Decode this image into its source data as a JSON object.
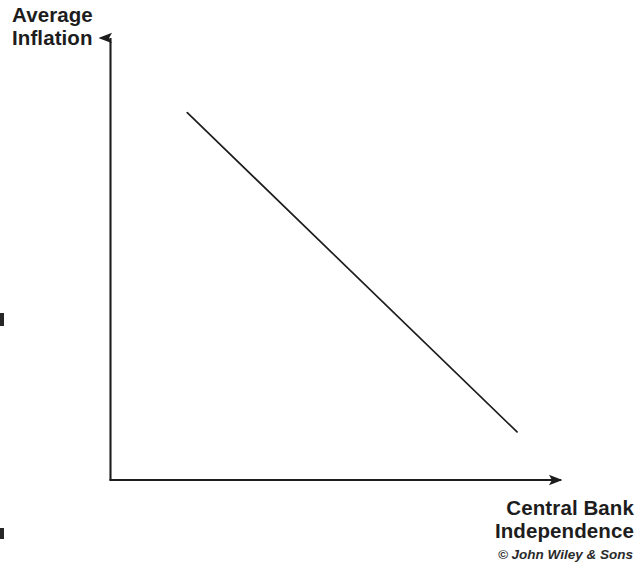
{
  "figure": {
    "background_color": "#ffffff",
    "ink_color": "#1d1d1d",
    "credit": "© John Wiley & Sons"
  },
  "labels": {
    "y_axis": {
      "line1": "Average",
      "line2": "Inflation"
    },
    "x_axis": {
      "line1": "Central Bank",
      "line2": "Independence"
    }
  },
  "chart_data": {
    "type": "line",
    "title": "",
    "subtitle": "",
    "xlabel": "Central Bank Independence",
    "ylabel": "Average Inflation",
    "annotations": [
      "© John Wiley & Sons"
    ],
    "legend": [],
    "legend_position": "none",
    "grid": false,
    "axes_style": "arrow-headed open axes, no tick marks, no tick labels",
    "xlim": [
      0,
      1
    ],
    "ylim": [
      0,
      1
    ],
    "xticks": [],
    "yticks": [],
    "xticklabels": [],
    "yticklabels": [],
    "series": [
      {
        "name": "Inflation vs. central bank independence",
        "relationship": "negative",
        "style": "solid straight line",
        "color": "#1d1d1d",
        "x": [
          0.166,
          0.879
        ],
        "y": [
          0.809,
          0.106
        ],
        "description": "Downward sloping straight line indicating that higher central bank independence is associated with lower average inflation"
      }
    ]
  }
}
